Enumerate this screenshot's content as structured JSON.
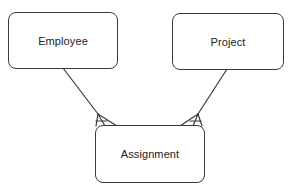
{
  "diagram": {
    "type": "entity-relationship",
    "notation": "crow's foot",
    "entities": [
      {
        "id": "employee",
        "label": "Employee"
      },
      {
        "id": "project",
        "label": "Project"
      },
      {
        "id": "assignment",
        "label": "Assignment"
      }
    ],
    "relationships": [
      {
        "from": "employee",
        "to": "assignment",
        "from_cardinality": "one",
        "to_cardinality": "many"
      },
      {
        "from": "project",
        "to": "assignment",
        "from_cardinality": "one",
        "to_cardinality": "many"
      }
    ],
    "colors": {
      "stroke": "#3a3a3a",
      "text": "#222222",
      "background": "#ffffff"
    }
  }
}
